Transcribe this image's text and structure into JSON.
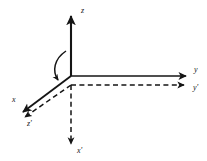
{
  "figure": {
    "background_color": "#ffffff",
    "stroke_color": "#151515",
    "label_color": "#151515",
    "origin": {
      "x": 71,
      "y": 76
    },
    "axes": [
      {
        "id": "z",
        "label": "z",
        "style": "solid",
        "direction": "up",
        "label_x": 81,
        "label_y": 11,
        "line": {
          "x1": 71,
          "y1": 76,
          "x2": 71,
          "y2": 14
        },
        "arrow": "at-tip"
      },
      {
        "id": "y",
        "label": "y",
        "style": "solid",
        "direction": "right",
        "label_x": 196,
        "label_y": 71,
        "line": {
          "x1": 71,
          "y1": 76,
          "x2": 188,
          "y2": 76
        },
        "arrow": "at-tip"
      },
      {
        "id": "x",
        "label": "x",
        "style": "solid",
        "direction": "down-left",
        "label_x": 14,
        "label_y": 100,
        "line": {
          "x1": 71,
          "y1": 76,
          "x2": 20,
          "y2": 114
        },
        "arrow": "at-tip"
      },
      {
        "id": "x-prime",
        "label": "x'",
        "style": "dashed",
        "direction": "down",
        "label_x": 73,
        "label_y": 150,
        "line": {
          "x1": 71,
          "y1": 85,
          "x2": 71,
          "y2": 146
        },
        "arrow": "at-tip"
      },
      {
        "id": "y-prime",
        "label": "y'",
        "style": "dashed",
        "direction": "right",
        "label_x": 196,
        "label_y": 88,
        "line": {
          "x1": 71,
          "y1": 85,
          "x2": 188,
          "y2": 85
        },
        "arrow": "at-tip"
      },
      {
        "id": "z-prime",
        "label": "z'",
        "style": "dashed",
        "direction": "down-left",
        "label_x": 27,
        "label_y": 122,
        "line": {
          "x1": 71,
          "y1": 85,
          "x2": 22,
          "y2": 119
        },
        "arrow": "at-tip"
      }
    ],
    "rotation_arc": {
      "id": "rotation-arc",
      "label": "",
      "style": "solid",
      "description": "curved arrow from z axis sweeping down toward x axis",
      "path": "M 67 52 C 55 58, 52 70, 58 79",
      "arrow": "at-tip"
    }
  }
}
